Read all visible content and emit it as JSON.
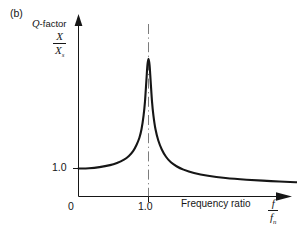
{
  "figure": {
    "panel_label": "(b)",
    "background_color": "#ffffff",
    "line_color": "#161616"
  },
  "labels": {
    "q_factor_italic": "Q",
    "q_factor_rest": "-factor",
    "y_axis_numerator": "X",
    "y_axis_denominator": "X",
    "y_axis_denominator_sub": "s",
    "y_tick_1": "1.0",
    "origin": "0",
    "x_tick_1": "1.0",
    "x_axis_title": "Frequency ratio",
    "x_axis_numerator": "f",
    "x_axis_denominator": "f",
    "x_axis_denominator_sub": "n"
  },
  "chart_data": {
    "type": "line",
    "title": "Q-factor",
    "xlabel": "Frequency ratio  f/f_n",
    "ylabel": "X/X_s",
    "xlim": [
      0,
      3.45
    ],
    "ylim": [
      0,
      5.4
    ],
    "grid": false,
    "legend": null,
    "x_ticks": [
      0,
      1.0
    ],
    "x_tick_labels": [
      "0",
      "1.0"
    ],
    "y_ticks": [
      1.0
    ],
    "y_tick_labels": [
      "1.0"
    ],
    "annotations": [
      {
        "type": "vline",
        "x": 1.0,
        "style": "dash-dot",
        "label": "resonance frequency ratio = 1.0"
      }
    ],
    "series": [
      {
        "name": "magnification factor",
        "comment": "Q-factor resonance curve: X/Xs vs f/fn, peak value ~4.9 at f/fn = 1.0",
        "x": [
          0.0,
          0.15,
          0.3,
          0.45,
          0.55,
          0.65,
          0.72,
          0.78,
          0.83,
          0.87,
          0.9,
          0.93,
          0.95,
          0.97,
          0.985,
          1.0,
          1.015,
          1.03,
          1.05,
          1.07,
          1.1,
          1.14,
          1.19,
          1.25,
          1.32,
          1.4,
          1.5,
          1.65,
          1.85,
          2.1,
          2.4,
          2.75,
          3.1,
          3.4
        ],
        "y": [
          1.0,
          1.01,
          1.05,
          1.12,
          1.2,
          1.32,
          1.45,
          1.62,
          1.85,
          2.1,
          2.4,
          2.9,
          3.4,
          4.15,
          4.7,
          4.92,
          4.7,
          4.15,
          3.4,
          2.9,
          2.4,
          2.0,
          1.68,
          1.42,
          1.22,
          1.08,
          0.96,
          0.84,
          0.74,
          0.66,
          0.6,
          0.55,
          0.51,
          0.49
        ]
      }
    ]
  }
}
